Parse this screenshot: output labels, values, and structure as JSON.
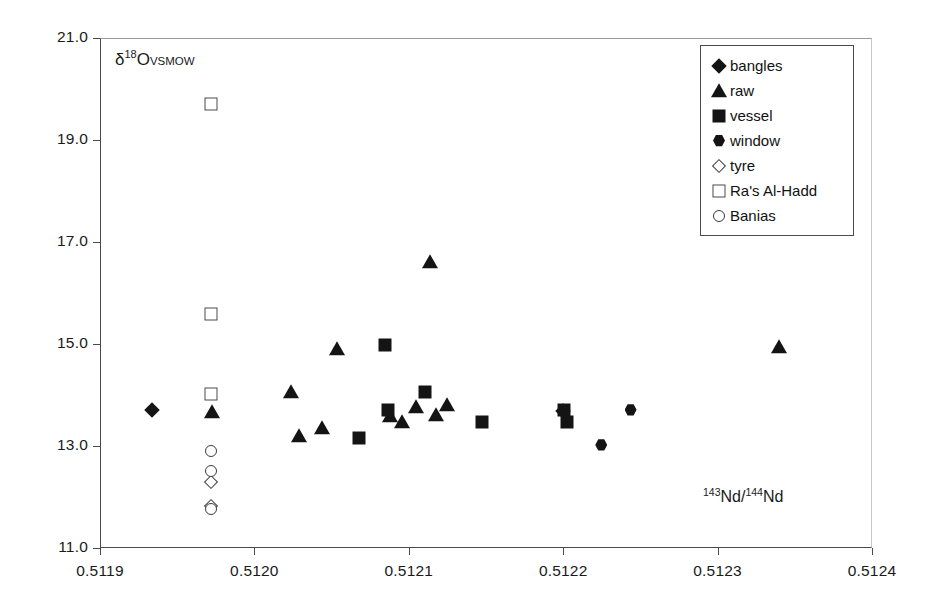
{
  "chart_data": {
    "type": "scatter",
    "title": "",
    "xlabel": "143Nd/144Nd",
    "ylabel": "d18O VSMOW",
    "xlim": [
      0.5119,
      0.5124
    ],
    "ylim": [
      11.0,
      21.0
    ],
    "xticks": [
      "0.5119",
      "0.5120",
      "0.5121",
      "0.5122",
      "0.5123",
      "0.5124"
    ],
    "xtick_values": [
      0.5119,
      0.512,
      0.5121,
      0.5122,
      0.5123,
      0.5124
    ],
    "yticks": [
      "11.0",
      "13.0",
      "15.0",
      "17.0",
      "19.0",
      "21.0"
    ],
    "ytick_values": [
      11.0,
      13.0,
      15.0,
      17.0,
      19.0,
      21.0
    ],
    "grid": false,
    "legend_position": "top-right",
    "series": [
      {
        "name": "bangles",
        "marker": "filled-diamond",
        "points": [
          {
            "x": 0.511933,
            "y": 13.72
          },
          {
            "x": 0.512199,
            "y": 13.7
          }
        ]
      },
      {
        "name": "raw",
        "marker": "filled-triangle",
        "points": [
          {
            "x": 0.511972,
            "y": 13.68
          },
          {
            "x": 0.512023,
            "y": 14.07
          },
          {
            "x": 0.512028,
            "y": 13.22
          },
          {
            "x": 0.512043,
            "y": 13.37
          },
          {
            "x": 0.512053,
            "y": 14.92
          },
          {
            "x": 0.512087,
            "y": 13.61
          },
          {
            "x": 0.512095,
            "y": 13.5
          },
          {
            "x": 0.512104,
            "y": 13.78
          },
          {
            "x": 0.512113,
            "y": 16.62
          },
          {
            "x": 0.512117,
            "y": 13.62
          },
          {
            "x": 0.512124,
            "y": 13.82
          },
          {
            "x": 0.512339,
            "y": 14.97
          }
        ]
      },
      {
        "name": "vessel",
        "marker": "filled-square",
        "points": [
          {
            "x": 0.512067,
            "y": 13.18
          },
          {
            "x": 0.512084,
            "y": 15.0
          },
          {
            "x": 0.512086,
            "y": 13.73
          },
          {
            "x": 0.51211,
            "y": 14.08
          },
          {
            "x": 0.512147,
            "y": 13.49
          },
          {
            "x": 0.5122,
            "y": 13.73
          },
          {
            "x": 0.512202,
            "y": 13.5
          }
        ]
      },
      {
        "name": "window",
        "marker": "filled-hexagon",
        "points": [
          {
            "x": 0.512224,
            "y": 13.04
          },
          {
            "x": 0.512243,
            "y": 13.73
          }
        ]
      },
      {
        "name": "tyre",
        "marker": "open-diamond",
        "points": [
          {
            "x": 0.511971,
            "y": 12.31
          },
          {
            "x": 0.511971,
            "y": 11.85
          }
        ]
      },
      {
        "name": "Ra's Al-Hadd",
        "marker": "open-square",
        "points": [
          {
            "x": 0.511971,
            "y": 19.72
          },
          {
            "x": 0.511971,
            "y": 15.6
          },
          {
            "x": 0.511971,
            "y": 14.04
          }
        ]
      },
      {
        "name": "Banias",
        "marker": "open-circle",
        "points": [
          {
            "x": 0.511971,
            "y": 12.92
          },
          {
            "x": 0.511971,
            "y": 12.52
          },
          {
            "x": 0.511971,
            "y": 11.78
          }
        ]
      }
    ]
  },
  "axis": {
    "ylabel_delta": "δ",
    "ylabel_sup": "18",
    "ylabel_o": "O",
    "ylabel_sub": "VSMOW",
    "xlabel_sup1": "143",
    "xlabel_mid": "Nd/",
    "xlabel_sup2": "144",
    "xlabel_end": "Nd"
  }
}
